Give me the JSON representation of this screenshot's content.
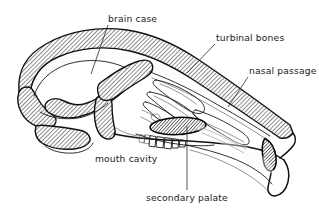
{
  "figure": {
    "background_color": "#ffffff",
    "line_color": "#111111",
    "text_color": "#1a1a1a",
    "width": 319,
    "height": 218
  },
  "labels": {
    "brain_case": "brain case",
    "turbinal_bones": "turbinal bones",
    "nasal_passage": "nasal passage",
    "mouth_cavity": "mouth cavity",
    "secondary_palate": "secondary palate"
  }
}
